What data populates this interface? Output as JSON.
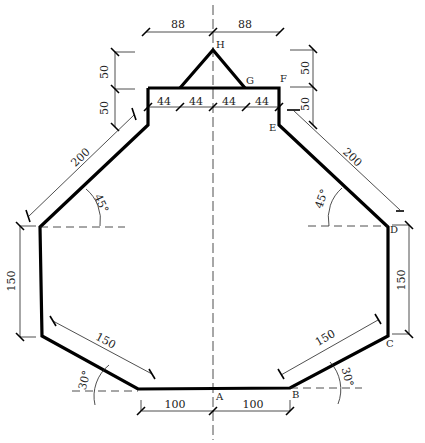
{
  "diagram": {
    "type": "engineering-dimension-drawing",
    "points": {
      "A": "A",
      "B": "B",
      "C": "C",
      "D": "D",
      "E": "E",
      "F": "F",
      "G": "G",
      "H": "H"
    },
    "dimensions": {
      "top_left_88": "88",
      "top_right_88": "88",
      "left_upper_50": "50",
      "left_lower_50": "50",
      "right_upper_50": "50",
      "right_lower_50": "50",
      "seg_44_1": "44",
      "seg_44_2": "44",
      "seg_44_3": "44",
      "seg_44_4": "44",
      "left_slant_200": "200",
      "right_slant_200": "200",
      "left_angle_45": "45°",
      "right_angle_45": "45°",
      "left_vertical_150": "150",
      "right_vertical_150": "150",
      "left_lower_slant_150": "150",
      "right_lower_slant_150": "150",
      "left_angle_30": "30°",
      "right_angle_30": "30°",
      "bottom_left_100": "100",
      "bottom_right_100": "100"
    }
  }
}
